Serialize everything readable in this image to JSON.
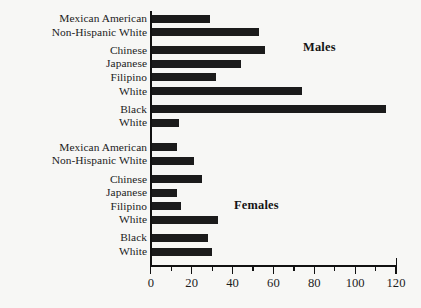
{
  "chart_data": {
    "type": "bar",
    "orientation": "horizontal",
    "title": "",
    "subtitle": "",
    "xlabel": "",
    "ylabel": "",
    "xlim": [
      0,
      120
    ],
    "ylim": null,
    "grid": false,
    "legend_position": "none",
    "xticks": [
      0,
      20,
      40,
      60,
      80,
      100,
      120
    ],
    "xtick_labels": [
      "0",
      "20",
      "40",
      "60",
      "80",
      "100",
      "120"
    ],
    "minor_xticks": [
      10,
      30,
      50,
      70,
      90,
      110
    ],
    "bar_color": "#1b1b1b",
    "annotations": [
      {
        "text": "Males",
        "group": "males"
      },
      {
        "text": "Females",
        "group": "females"
      }
    ],
    "groups": [
      {
        "name": "Males",
        "categories": [
          "Mexican American",
          "Non-Hispanic White",
          "Chinese",
          "Japanese",
          "Filipino",
          "White",
          "Black",
          "White"
        ],
        "values": [
          29,
          53,
          56,
          44,
          32,
          74,
          115,
          14
        ]
      },
      {
        "name": "Females",
        "categories": [
          "Mexican American",
          "Non-Hispanic White",
          "Chinese",
          "Japanese",
          "Filipino",
          "White",
          "Black",
          "White"
        ],
        "values": [
          13,
          21,
          25,
          13,
          15,
          33,
          28,
          30
        ]
      }
    ]
  },
  "bars": [
    {
      "label": "Mexican American",
      "value": 29,
      "group": "males"
    },
    {
      "label": "Non-Hispanic White",
      "value": 53,
      "group": "males"
    },
    {
      "label": "Chinese",
      "value": 56,
      "group": "males"
    },
    {
      "label": "Japanese",
      "value": 44,
      "group": "males"
    },
    {
      "label": "Filipino",
      "value": 32,
      "group": "males"
    },
    {
      "label": "White",
      "value": 74,
      "group": "males"
    },
    {
      "label": "Black",
      "value": 115,
      "group": "males"
    },
    {
      "label": "White",
      "value": 14,
      "group": "males"
    },
    {
      "label": "Mexican American",
      "value": 13,
      "group": "females"
    },
    {
      "label": "Non-Hispanic White",
      "value": 21,
      "group": "females"
    },
    {
      "label": "Chinese",
      "value": 25,
      "group": "females"
    },
    {
      "label": "Japanese",
      "value": 13,
      "group": "females"
    },
    {
      "label": "Filipino",
      "value": 15,
      "group": "females"
    },
    {
      "label": "White",
      "value": 33,
      "group": "females"
    },
    {
      "label": "Black",
      "value": 28,
      "group": "females"
    },
    {
      "label": "White",
      "value": 30,
      "group": "females"
    }
  ],
  "notes": {
    "males": "Males",
    "females": "Females"
  }
}
